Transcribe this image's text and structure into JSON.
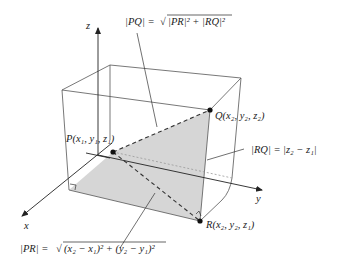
{
  "figure": {
    "axes": {
      "x_label": "x",
      "y_label": "y",
      "z_label": "z"
    },
    "points": {
      "P": {
        "name": "P",
        "coords": "(x₁, y₁, z₁)"
      },
      "Q": {
        "name": "Q",
        "coords": "(x₂, y₂, z₂)"
      },
      "R": {
        "name": "R",
        "coords": "(x₂, y₂, z₁)"
      }
    },
    "formulas": {
      "PQ_lhs": "|PQ| = ",
      "PQ_rad": "|PR|² + |RQ|²",
      "RQ": "|RQ| = |z₂ − z₁|",
      "PR_lhs": "|PR| = ",
      "PR_rad": "(x₂ − x₁)² + (y₂ − y₁)²"
    },
    "colors": {
      "shade": "#d4d4d4",
      "line": "#333333",
      "point": "#111111"
    }
  }
}
